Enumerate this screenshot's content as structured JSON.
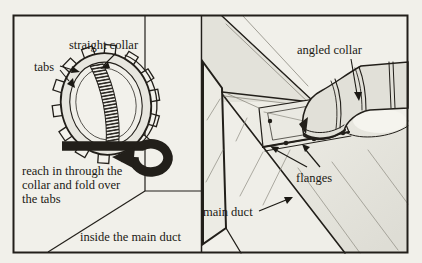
{
  "illustration": {
    "left_panel": {
      "straight_collar_label": "straight collar",
      "tabs_label": "tabs",
      "caption_lines": [
        "reach in through the",
        "collar and fold over",
        "the tabs"
      ],
      "footer_label": "inside the main duct"
    },
    "right_panel": {
      "angled_collar_label": "angled collar",
      "flanges_label": "flanges",
      "main_duct_label": "main duct"
    },
    "colors": {
      "paper": "#f1f0ea",
      "shading": "#e3e2da",
      "line": "#221f1a",
      "text": "#1b1914"
    }
  }
}
